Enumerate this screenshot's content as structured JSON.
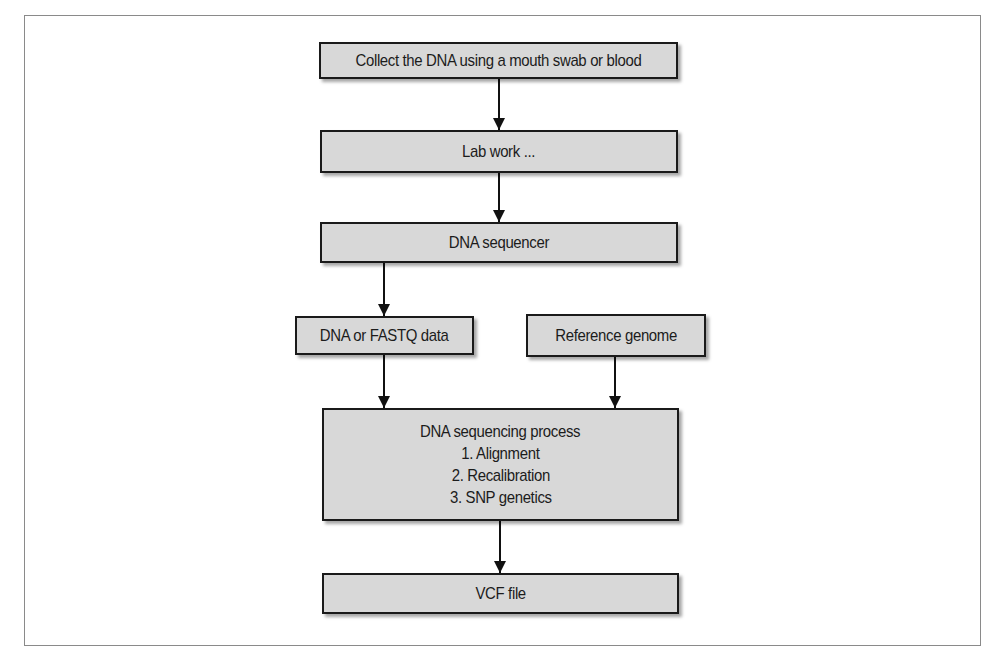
{
  "diagram": {
    "type": "flowchart",
    "nodes": [
      {
        "id": "collect",
        "label": "Collect the DNA using a mouth swab or blood"
      },
      {
        "id": "lab",
        "label": "Lab work ..."
      },
      {
        "id": "sequencer",
        "label": "DNA sequencer"
      },
      {
        "id": "fastq",
        "label": "DNA or FASTQ data"
      },
      {
        "id": "reference",
        "label": "Reference genome"
      },
      {
        "id": "process",
        "label": "DNA sequencing process",
        "steps": [
          "1. Alignment",
          "2. Recalibration",
          "3. SNP genetics"
        ]
      },
      {
        "id": "vcf",
        "label": "VCF file"
      }
    ],
    "edges": [
      {
        "from": "collect",
        "to": "lab"
      },
      {
        "from": "lab",
        "to": "sequencer"
      },
      {
        "from": "sequencer",
        "to": "fastq"
      },
      {
        "from": "fastq",
        "to": "process"
      },
      {
        "from": "reference",
        "to": "process"
      },
      {
        "from": "process",
        "to": "vcf"
      }
    ],
    "colors": {
      "box_fill": "#d8d8d8",
      "box_border": "#1a1a1a",
      "frame": "#8a8a8a"
    }
  }
}
